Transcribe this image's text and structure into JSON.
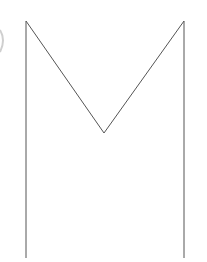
{
  "figure": {
    "stroke_color": "#555555",
    "arc_color": "#cccccc",
    "points": {
      "left_top": [
        26,
        21
      ],
      "left_bottom": [
        26,
        258
      ],
      "middle_vertex": [
        104,
        133
      ],
      "right_top": [
        184,
        21
      ],
      "right_bottom": [
        184,
        258
      ]
    }
  }
}
